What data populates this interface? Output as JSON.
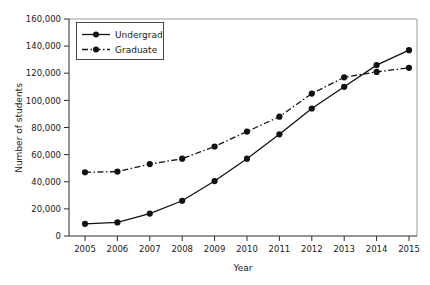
{
  "chart_data": {
    "type": "line",
    "title": "",
    "xlabel": "Year",
    "ylabel": "Number of students",
    "categories": [
      "2005",
      "2006",
      "2007",
      "2008",
      "2009",
      "2010",
      "2011",
      "2012",
      "2013",
      "2014",
      "2015"
    ],
    "x": [
      2005,
      2006,
      2007,
      2008,
      2009,
      2010,
      2011,
      2012,
      2013,
      2014,
      2015
    ],
    "xlim": [
      2005,
      2015
    ],
    "ylim": [
      0,
      160000
    ],
    "ytick_values": [
      0,
      20000,
      40000,
      60000,
      80000,
      100000,
      120000,
      140000,
      160000
    ],
    "ytick_labels": [
      "0",
      "20,000",
      "40,000",
      "60,000",
      "80,000",
      "100,000",
      "120,000",
      "140,000",
      "160,000"
    ],
    "grid": false,
    "legend_position": "top-left-inside",
    "series": [
      {
        "name": "Undergrad",
        "linestyle": "solid",
        "marker": "circle",
        "color": "#111111",
        "values": [
          9000,
          10000,
          16500,
          26000,
          40500,
          57000,
          75000,
          94000,
          110000,
          126000,
          137000
        ]
      },
      {
        "name": "Graduate",
        "linestyle": "dash-dot",
        "marker": "circle",
        "color": "#111111",
        "values": [
          47000,
          47500,
          53000,
          57000,
          66000,
          77000,
          88000,
          105000,
          117000,
          121000,
          124000
        ]
      }
    ]
  },
  "legend": {
    "entries": [
      {
        "label": "Undergrad"
      },
      {
        "label": "Graduate"
      }
    ]
  },
  "axes": {
    "x_title": "Year",
    "y_title": "Number of students"
  }
}
